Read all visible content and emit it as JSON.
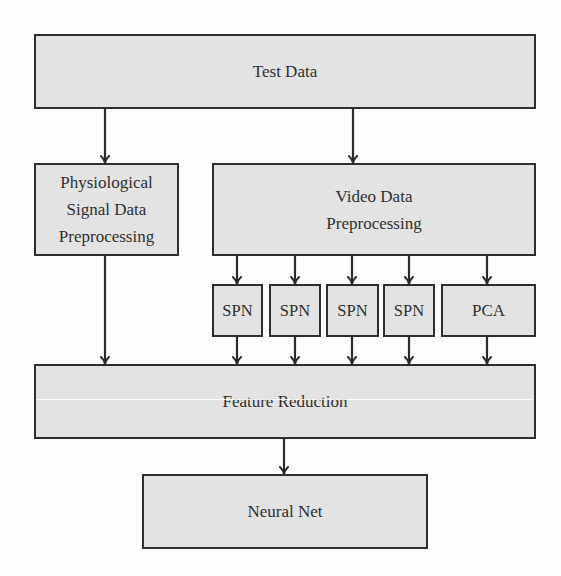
{
  "diagram": {
    "title": "",
    "nodes": [
      {
        "id": "test_data",
        "label": "Test Data",
        "x": 34,
        "y": 34,
        "w": 502,
        "h": 75
      },
      {
        "id": "physio_pre",
        "label": "Physiological\nSignal Data\nPreprocessing",
        "x": 34,
        "y": 163,
        "w": 145,
        "h": 93
      },
      {
        "id": "video_pre",
        "label": "Video Data\nPreprocessing",
        "x": 212,
        "y": 163,
        "w": 324,
        "h": 93
      },
      {
        "id": "spn1",
        "label": "SPN",
        "x": 212,
        "y": 284,
        "w": 51,
        "h": 53
      },
      {
        "id": "spn2",
        "label": "SPN",
        "x": 269,
        "y": 284,
        "w": 52,
        "h": 53
      },
      {
        "id": "spn3",
        "label": "SPN",
        "x": 326,
        "y": 284,
        "w": 53,
        "h": 53
      },
      {
        "id": "spn4",
        "label": "SPN",
        "x": 383,
        "y": 284,
        "w": 52,
        "h": 53
      },
      {
        "id": "pca",
        "label": "PCA",
        "x": 441,
        "y": 284,
        "w": 95,
        "h": 53
      },
      {
        "id": "feature_reduction",
        "label": "Feature Reduction",
        "x": 34,
        "y": 364,
        "w": 502,
        "h": 75
      },
      {
        "id": "neural_net",
        "label": "Neural Net",
        "x": 142,
        "y": 474,
        "w": 286,
        "h": 75
      }
    ],
    "edges": [
      {
        "from": "test_data",
        "to": "physio_pre",
        "x": 105,
        "y1": 108,
        "y2": 163
      },
      {
        "from": "test_data",
        "to": "video_pre",
        "x": 353,
        "y1": 108,
        "y2": 163
      },
      {
        "from": "video_pre",
        "to": "spn1",
        "x": 237,
        "y1": 255,
        "y2": 284
      },
      {
        "from": "video_pre",
        "to": "spn2",
        "x": 295,
        "y1": 255,
        "y2": 284
      },
      {
        "from": "video_pre",
        "to": "spn3",
        "x": 352,
        "y1": 255,
        "y2": 284
      },
      {
        "from": "video_pre",
        "to": "spn4",
        "x": 409,
        "y1": 255,
        "y2": 284
      },
      {
        "from": "video_pre",
        "to": "pca",
        "x": 487,
        "y1": 255,
        "y2": 284
      },
      {
        "from": "physio_pre",
        "to": "feature_reduction",
        "x": 105,
        "y1": 255,
        "y2": 364
      },
      {
        "from": "spn1",
        "to": "feature_reduction",
        "x": 237,
        "y1": 336,
        "y2": 364
      },
      {
        "from": "spn2",
        "to": "feature_reduction",
        "x": 295,
        "y1": 336,
        "y2": 364
      },
      {
        "from": "spn3",
        "to": "feature_reduction",
        "x": 352,
        "y1": 336,
        "y2": 364
      },
      {
        "from": "spn4",
        "to": "feature_reduction",
        "x": 409,
        "y1": 336,
        "y2": 364
      },
      {
        "from": "pca",
        "to": "feature_reduction",
        "x": 487,
        "y1": 336,
        "y2": 364
      },
      {
        "from": "feature_reduction",
        "to": "neural_net",
        "x": 284,
        "y1": 438,
        "y2": 474
      }
    ],
    "colors": {
      "box_fill": "#e3e3e3",
      "box_stroke": "#2e2e2e",
      "text": "#2f2f2f",
      "arrow": "#2a2a2a",
      "background": "#fdfdfd"
    }
  },
  "labels": {
    "test_data": "Test Data",
    "physio_pre": "Physiological\nSignal Data\nPreprocessing",
    "video_pre": "Video Data\nPreprocessing",
    "spn1": "SPN",
    "spn2": "SPN",
    "spn3": "SPN",
    "spn4": "SPN",
    "pca": "PCA",
    "feature_reduction": "Feature Reduction",
    "neural_net": "Neural Net"
  }
}
